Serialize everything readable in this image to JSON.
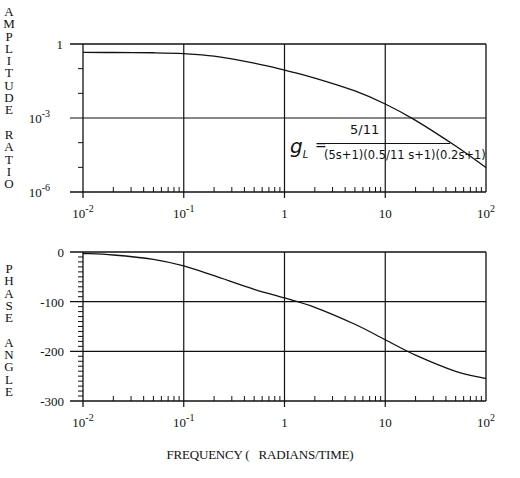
{
  "amplitude_plot": {
    "ylabel": "AMPLITUDE RATIO",
    "ylabel_letters": [
      "A",
      "M",
      "P",
      "L",
      "I",
      "T",
      "U",
      "D",
      "E",
      "",
      "R",
      "A",
      "T",
      "I",
      "O"
    ],
    "yticks": [
      {
        "value": 1,
        "label": "1",
        "sup": ""
      },
      {
        "value": 0.001,
        "label": "10",
        "sup": "-3"
      },
      {
        "value": 1e-06,
        "label": "10",
        "sup": "-6"
      }
    ],
    "formula": {
      "lhs": "g",
      "lhs_sub": "L",
      "numerator": "5/11",
      "denominator": "(5s+1)(0.5/11 s+1)(0.2s+1)"
    }
  },
  "phase_plot": {
    "ylabel": "PHASE ANGLE",
    "ylabel_letters": [
      "P",
      "H",
      "A",
      "S",
      "E",
      "",
      "A",
      "N",
      "G",
      "L",
      "E"
    ],
    "yticks": [
      {
        "value": 0,
        "label": "0"
      },
      {
        "value": -100,
        "label": "-100"
      },
      {
        "value": -200,
        "label": "-200"
      },
      {
        "value": -300,
        "label": "-300"
      }
    ]
  },
  "xaxis": {
    "title": "FREQUENCY (   RADIANS/TIME)",
    "ticks": [
      {
        "value": 0.01,
        "label": "10",
        "sup": "-2"
      },
      {
        "value": 0.1,
        "label": "10",
        "sup": "-1"
      },
      {
        "value": 1,
        "label": "1",
        "sup": ""
      },
      {
        "value": 10,
        "label": "10",
        "sup": ""
      },
      {
        "value": 100,
        "label": "10",
        "sup": "2"
      }
    ]
  },
  "chart_data": [
    {
      "type": "line",
      "title": "Bode plot - Amplitude Ratio",
      "xlabel": "FREQUENCY ( RADIANS/TIME)",
      "ylabel": "AMPLITUDE RATIO",
      "xscale": "log",
      "yscale": "log",
      "xlim": [
        0.01,
        100
      ],
      "ylim": [
        1e-06,
        1
      ],
      "grid": true,
      "annotation": "g_L = (5/11) / ((5s+1)((0.5/11)s+1)(0.2s+1))",
      "x": [
        0.01,
        0.02,
        0.05,
        0.1,
        0.2,
        0.5,
        1,
        2,
        5,
        10,
        20,
        50,
        100
      ],
      "series": [
        {
          "name": "amplitude ratio",
          "values": [
            0.4539,
            0.4523,
            0.4409,
            0.4065,
            0.3214,
            0.1679,
            0.0874,
            0.0418,
            0.01252,
            0.003701,
            0.000804,
            7.27e-05,
            9.76e-06
          ]
        }
      ]
    },
    {
      "type": "line",
      "title": "Bode plot - Phase Angle",
      "xlabel": "FREQUENCY ( RADIANS/TIME)",
      "ylabel": "PHASE ANGLE",
      "xscale": "log",
      "xlim": [
        0.01,
        100
      ],
      "ylim": [
        -300,
        0
      ],
      "grid": true,
      "x": [
        0.01,
        0.02,
        0.05,
        0.1,
        0.2,
        0.5,
        1,
        2,
        5,
        10,
        20,
        50,
        100
      ],
      "series": [
        {
          "name": "phase angle (deg)",
          "values": [
            -3.0,
            -6.0,
            -14.7,
            -28.0,
            -47.8,
            -75.2,
            -92.6,
            -111.3,
            -145.5,
            -176.7,
            -207.7,
            -240.3,
            -254.6
          ]
        }
      ]
    }
  ]
}
